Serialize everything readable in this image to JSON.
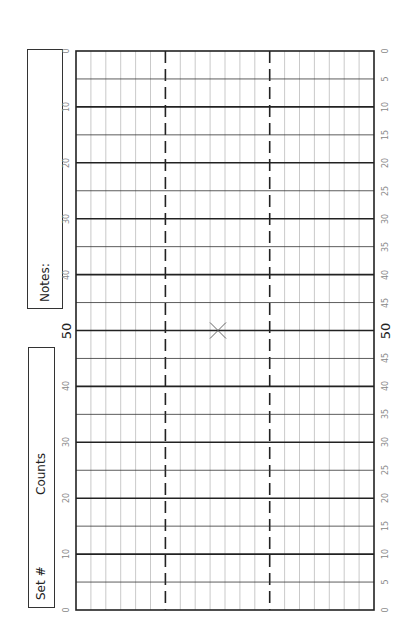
{
  "sheet": {
    "notes_label": "Notes:",
    "set_label": "Set #",
    "counts_label": "Counts",
    "center_mark": "X"
  },
  "grid": {
    "left": 76,
    "right": 374,
    "top": 51,
    "bottom": 610,
    "columns": 20,
    "dashed_columns": [
      6,
      13
    ],
    "rows": 20,
    "major_every": 2
  },
  "left_axis": {
    "labels": [
      "0",
      "10",
      "20",
      "30",
      "40",
      "50",
      "40",
      "30",
      "20",
      "10",
      "0"
    ],
    "big_index": 5
  },
  "right_axis": {
    "labels": [
      "0",
      "5",
      "10",
      "15",
      "20",
      "25",
      "30",
      "35",
      "40",
      "45",
      "50",
      "45",
      "40",
      "35",
      "30",
      "25",
      "20",
      "15",
      "10",
      "5",
      "0"
    ],
    "big_index": 10
  },
  "colors": {
    "major_line": "#222222",
    "minor_line": "#bbbbbb",
    "mid_line": "#333333",
    "tick_text": "#888888"
  }
}
